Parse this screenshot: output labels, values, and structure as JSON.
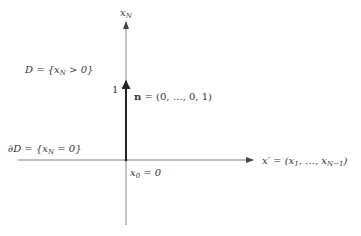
{
  "diagram": {
    "colors": {
      "axis": "#555555",
      "vector": "#222222",
      "text": "#333333",
      "background": "#ffffff"
    },
    "axes": {
      "vertical": {
        "label_base": "x",
        "label_sub": "N"
      },
      "horizontal": {
        "label": "x′ = (x",
        "label_sub1": "1",
        "label_mid": ", …, x",
        "label_sub2": "N−1",
        "label_end": ")"
      }
    },
    "region": {
      "pre": "D = {x",
      "sub": "N",
      "post": " > 0}"
    },
    "boundary": {
      "pre": "∂D = {x",
      "sub": "N",
      "post": " = 0}"
    },
    "vector": {
      "name": "n",
      "value": " = (0, …, 0, 1)",
      "tick_label": "1"
    },
    "origin": {
      "base": "x",
      "sub": "0",
      "post": " = 0"
    }
  }
}
